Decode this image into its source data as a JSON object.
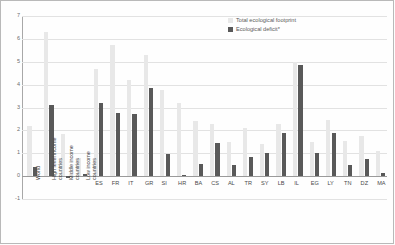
{
  "chart_data": {
    "type": "bar",
    "title": "",
    "subtitle": "",
    "xlabel": "",
    "ylabel": "",
    "ylim": [
      -1,
      7
    ],
    "yticks": [
      -1,
      0,
      1,
      2,
      3,
      4,
      5,
      6,
      7
    ],
    "ytick_labels": [
      "-1",
      "0",
      "1",
      "2",
      "3",
      "4",
      "5",
      "6",
      "7"
    ],
    "grid": true,
    "legend_position": "top-right",
    "categories": [
      "World",
      "High level income countries",
      "Middle income countries",
      "Low income countries",
      "ES",
      "FR",
      "IT",
      "GR",
      "SI",
      "HR",
      "BA",
      "CS",
      "AL",
      "TR",
      "SY",
      "LB",
      "IL",
      "EG",
      "LY",
      "TN",
      "DZ",
      "MA"
    ],
    "series": [
      {
        "name": "Total ecological footprint",
        "color": "#e8e8e8",
        "values": [
          2.2,
          6.3,
          1.85,
          0.8,
          4.7,
          5.75,
          4.2,
          5.3,
          3.75,
          3.2,
          2.4,
          2.3,
          1.5,
          2.1,
          1.4,
          2.3,
          5.0,
          1.5,
          2.45,
          1.55,
          1.75,
          1.1
        ]
      },
      {
        "name": "Ecological deficit*",
        "color": "#595959",
        "values": [
          0.4,
          3.1,
          -0.1,
          0.1,
          3.2,
          2.75,
          2.7,
          3.85,
          0.95,
          0.05,
          0.55,
          1.45,
          0.5,
          0.85,
          1.0,
          1.9,
          4.85,
          1.0,
          1.9,
          0.5,
          0.75,
          0.15
        ]
      }
    ],
    "legend": [
      {
        "label": "Total ecological footprint",
        "swatch": "light"
      },
      {
        "label": "Ecological deficit*",
        "swatch": "dark"
      }
    ],
    "group_breaks": [
      4
    ]
  }
}
